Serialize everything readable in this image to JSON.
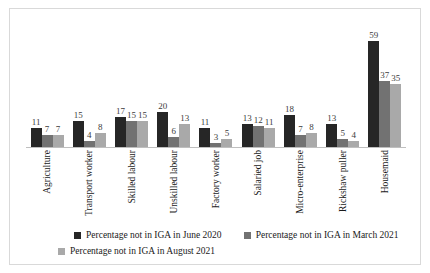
{
  "chart_data": {
    "type": "bar",
    "title": "",
    "subtitle": "",
    "xlabel": "",
    "ylabel": "",
    "ylim": [
      0,
      65
    ],
    "grid": false,
    "legend_position": "bottom",
    "categories": [
      "Agriculture",
      "Transport worker",
      "Skilled labour",
      "Unskilled labour",
      "Factory worker",
      "Salaried job",
      "Micro-enterprise",
      "Rickshaw puller",
      "Housemaid"
    ],
    "series": [
      {
        "name": "Percentage not in IGA in June 2020",
        "color": "#262626",
        "values": [
          11,
          15,
          17,
          20,
          11,
          13,
          18,
          13,
          59
        ]
      },
      {
        "name": "Percentage not in IGA in March 2021",
        "color": "#727272",
        "values": [
          7,
          4,
          15,
          6,
          3,
          12,
          7,
          5,
          37
        ]
      },
      {
        "name": "Percentage not in IGA in August 2021",
        "color": "#a9a9a9",
        "values": [
          7,
          8,
          15,
          13,
          5,
          11,
          8,
          4,
          35
        ]
      }
    ],
    "data_labels_shown": true
  },
  "legend": {
    "items": [
      {
        "label": "Percentage not in IGA in June 2020",
        "swatch": "s0"
      },
      {
        "label": "Percentage not in IGA in March 2021",
        "swatch": "s1"
      },
      {
        "label": "Percentage not in IGA in August 2021",
        "swatch": "s2"
      }
    ]
  },
  "colors": {
    "series_1": "#262626",
    "series_2": "#727272",
    "series_3": "#a9a9a9",
    "frame": "#d9d9d9",
    "baseline": "#bfbfbf",
    "background": "#ffffff",
    "text": "#1a1a1a"
  }
}
